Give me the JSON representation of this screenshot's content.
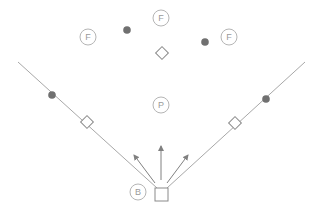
{
  "diagram": {
    "type": "baseball-field",
    "colors": {
      "line": "#a8a8a8",
      "circle_stroke": "#b5b5b5",
      "label": "#9a9a9a",
      "runner_dot": "#707070",
      "base_stroke": "#8a8a8a",
      "arrow": "#808080"
    },
    "foul_lines": [
      {
        "name": "left-foul-line",
        "x1": 18,
        "y1": 62,
        "x2": 157,
        "y2": 188
      },
      {
        "name": "right-foul-line",
        "x1": 305,
        "y1": 62,
        "x2": 167,
        "y2": 188
      }
    ],
    "fielders": [
      {
        "name": "left-fielder",
        "label": "F",
        "cx": 88,
        "cy": 37
      },
      {
        "name": "center-fielder",
        "label": "F",
        "cx": 161,
        "cy": 18
      },
      {
        "name": "right-fielder",
        "label": "F",
        "cx": 229,
        "cy": 37
      },
      {
        "name": "pitcher",
        "label": "P",
        "cx": 161,
        "cy": 105
      },
      {
        "name": "batter",
        "label": "B",
        "cx": 138,
        "cy": 192
      }
    ],
    "runner_dots": [
      {
        "name": "dot-left-outfield",
        "cx": 127,
        "cy": 30
      },
      {
        "name": "dot-right-outfield",
        "cx": 205,
        "cy": 42
      },
      {
        "name": "dot-left-line",
        "cx": 52,
        "cy": 95
      },
      {
        "name": "dot-right-line",
        "cx": 266,
        "cy": 99
      }
    ],
    "bases": [
      {
        "name": "second-base",
        "cx": 162,
        "cy": 53,
        "size": 9
      },
      {
        "name": "third-base",
        "cx": 87,
        "cy": 122,
        "size": 9
      },
      {
        "name": "first-base",
        "cx": 235,
        "cy": 123,
        "size": 9
      }
    ],
    "home_plate": {
      "x": 155,
      "y": 188,
      "w": 13,
      "h": 13
    },
    "arrows": [
      {
        "name": "arrow-left",
        "x1": 155,
        "y1": 183,
        "x2": 134,
        "y2": 155
      },
      {
        "name": "arrow-center",
        "x1": 161,
        "y1": 180,
        "x2": 161,
        "y2": 146
      },
      {
        "name": "arrow-right",
        "x1": 167,
        "y1": 183,
        "x2": 188,
        "y2": 155
      }
    ]
  }
}
